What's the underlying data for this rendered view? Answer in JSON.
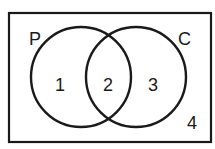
{
  "diagram": {
    "type": "venn",
    "universe": {
      "region_label": "4"
    },
    "sets": [
      {
        "name": "P",
        "label": "P"
      },
      {
        "name": "C",
        "label": "C"
      }
    ],
    "regions": [
      {
        "id": "only-P",
        "label": "1"
      },
      {
        "id": "P-and-C",
        "label": "2"
      },
      {
        "id": "only-C",
        "label": "3"
      },
      {
        "id": "neither",
        "label": "4"
      }
    ],
    "colors": {
      "stroke": "#1a1a1a",
      "background": "#ffffff"
    }
  }
}
